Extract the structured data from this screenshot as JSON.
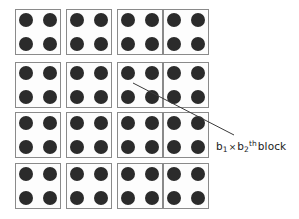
{
  "figure": {
    "background_color": "#ffffff",
    "type": "block-grid-diagram"
  },
  "grid": {
    "rows": 4,
    "columns": 4,
    "cell_count": 16,
    "cell_width": 46,
    "cell_height": 46,
    "column_x": [
      15,
      66,
      117,
      163
    ],
    "row_y": [
      9,
      62,
      112,
      163
    ],
    "cell_border_color": "#8a8a8a",
    "cell_background_color": "#fdfdfd",
    "dots_per_cell": 4,
    "dot_layout": "2x2",
    "dot_diameter": 14,
    "dot_color": "#2b2b2b",
    "dot_offsets": [
      {
        "x": 3,
        "y": 3
      },
      {
        "x": 27,
        "y": 3
      },
      {
        "x": 3,
        "y": 27
      },
      {
        "x": 27,
        "y": 27
      }
    ]
  },
  "annotation": {
    "label_prefix": "b",
    "sub_1": "1",
    "times": "×",
    "label_second": "b",
    "sub_2": "2",
    "superscript": "th",
    "word": "block",
    "label_full": "b1 × b2 th block",
    "label_x": 216,
    "label_y": 140,
    "leader_line": {
      "x1": 133,
      "y1": 83,
      "x2": 234,
      "y2": 135,
      "color": "#3a3a3a",
      "width": 1
    }
  }
}
